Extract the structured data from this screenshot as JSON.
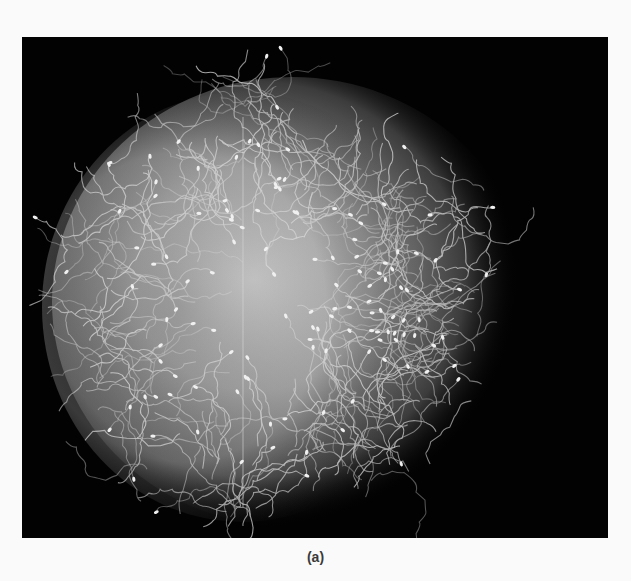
{
  "figure": {
    "background_color": "#020202",
    "egg_color": "#a8a8a8",
    "caption": "(a)"
  }
}
